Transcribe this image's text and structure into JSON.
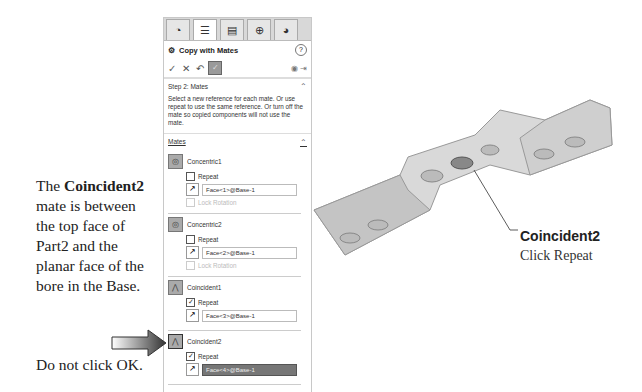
{
  "side_text": {
    "prefix": "The ",
    "bold": "Coincident2",
    "rest": " mate is between the top face of Part2 and the planar face of the bore in the Base."
  },
  "bottom_text": "Do not click OK.",
  "panel": {
    "tabs": [
      "feature-manager",
      "property-manager",
      "configuration-manager",
      "dim-expert",
      "display-manager"
    ],
    "title": "Copy with Mates",
    "help": "?",
    "step": {
      "label": "Step 2: Mates",
      "message": "Select a new reference for each mate. Or use repeat to use the same reference. Or turn off the mate so copied components will not use the mate."
    },
    "mates_label": "Mates",
    "mates": [
      {
        "name": "Concentric1",
        "repeat_label": "Repeat",
        "repeat_checked": false,
        "face": "Face<1>@Base-1",
        "lock_label": "Lock Rotation",
        "type": "concentric"
      },
      {
        "name": "Concentric2",
        "repeat_label": "Repeat",
        "repeat_checked": false,
        "face": "Face<2>@Base-1",
        "lock_label": "Lock Rotation",
        "type": "concentric"
      },
      {
        "name": "Coincident1",
        "repeat_label": "Repeat",
        "repeat_checked": true,
        "face": "Face<3>@Base-1",
        "type": "coincident"
      },
      {
        "name": "Coincident2",
        "repeat_label": "Repeat",
        "repeat_checked": true,
        "face": "Face<4>@Base-1",
        "type": "coincident",
        "selected": true
      }
    ]
  },
  "callout": {
    "title": "Coincident2",
    "subtitle": "Click Repeat"
  }
}
